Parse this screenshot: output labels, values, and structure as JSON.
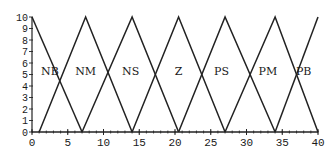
{
  "chart_data": {
    "type": "line",
    "title": "",
    "xlabel": "",
    "ylabel": "",
    "xlim": [
      0,
      40
    ],
    "ylim": [
      0,
      10
    ],
    "grid": false,
    "x_ticks": [
      "0",
      "5",
      "10",
      "15",
      "20",
      "25",
      "30",
      "35",
      "40"
    ],
    "y_ticks": [
      "0",
      "1",
      "2",
      "3",
      "4",
      "5",
      "6",
      "7",
      "8",
      "9",
      "10"
    ],
    "series": [
      {
        "name": "NB",
        "x": [
          0,
          7
        ],
        "y": [
          10,
          0
        ]
      },
      {
        "name": "NM",
        "x": [
          1,
          7.5,
          14
        ],
        "y": [
          0,
          10,
          0
        ]
      },
      {
        "name": "NS",
        "x": [
          7,
          14,
          20.5
        ],
        "y": [
          0,
          10,
          0
        ]
      },
      {
        "name": "Z",
        "x": [
          14,
          20.5,
          27
        ],
        "y": [
          0,
          10,
          0
        ]
      },
      {
        "name": "PS",
        "x": [
          20.5,
          27,
          34
        ],
        "y": [
          0,
          10,
          0
        ]
      },
      {
        "name": "PM",
        "x": [
          27,
          34,
          40
        ],
        "y": [
          0,
          10,
          0
        ]
      },
      {
        "name": "PB",
        "x": [
          34,
          40
        ],
        "y": [
          0,
          10
        ]
      }
    ],
    "annotations": [
      {
        "text": "NB",
        "x": 2.5,
        "y": 5.3
      },
      {
        "text": "NM",
        "x": 7.5,
        "y": 5.3
      },
      {
        "text": "NS",
        "x": 13.8,
        "y": 5.3
      },
      {
        "text": "Z",
        "x": 20.5,
        "y": 5.3
      },
      {
        "text": "PS",
        "x": 26.5,
        "y": 5.3
      },
      {
        "text": "PM",
        "x": 33,
        "y": 5.3
      },
      {
        "text": "PB",
        "x": 38,
        "y": 5.3
      }
    ],
    "line_color": "#222222"
  }
}
